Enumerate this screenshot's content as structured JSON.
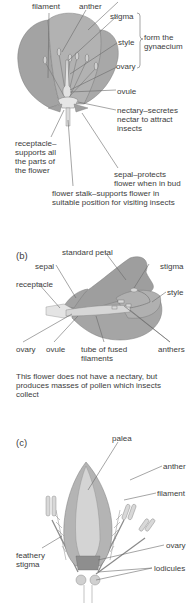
{
  "figure_a": {
    "labels": {
      "filament": "filament",
      "anther": "anther",
      "stigma": "stigma",
      "style": "style",
      "ovary": "ovary",
      "gynaecium_bracket": "form the\ngynaecium",
      "ovule": "ovule",
      "nectary": "nectary–secretes\nnectar to attract\ninsects",
      "receptacle": "receptacle–\nsupports all\nthe parts of\nthe flower",
      "sepal": "sepal–protects\nflower when in bud",
      "flower_stalk": "flower stalk–supports flower in\nsuitable position for visiting insects"
    }
  },
  "figure_b": {
    "panel_label": "(b)",
    "labels": {
      "standard_petal": "standard petal",
      "sepal": "sepal",
      "stigma": "stigma",
      "receptacle": "receptacle",
      "style": "style",
      "ovary": "ovary",
      "ovule": "ovule",
      "tube": "tube of fused\nfilaments",
      "anthers": "anthers"
    },
    "caption": "This flower does not have a nectary, but\nproduces masses of pollen which insects\ncollect"
  },
  "figure_c": {
    "panel_label": "(c)",
    "labels": {
      "palea": "palea",
      "anther": "anther",
      "filament": "filament",
      "feathery_stigma": "feathery\nstigma",
      "ovary": "ovary",
      "lodicules": "lodicules"
    }
  },
  "colors": {
    "petal_dark": "#9a9a9a",
    "petal_mid": "#b4b4b4",
    "petal_light": "#d2d2d2",
    "line": "#6a6a6a"
  }
}
